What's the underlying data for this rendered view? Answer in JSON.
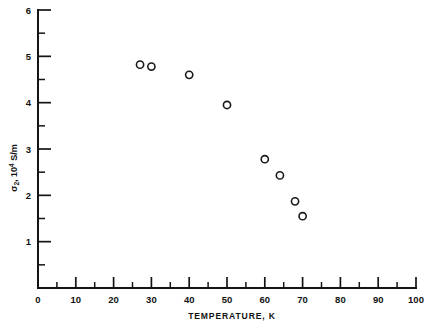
{
  "chart_data": {
    "type": "scatter",
    "title": "",
    "xlabel": "TEMPERATURE, K",
    "ylabel": "σ₂, 10⁴ S/m",
    "ylabel_parts": {
      "symbol": "σ",
      "subscript": "2",
      "separator": ", 10",
      "superscript": "4",
      "unit": " S/m"
    },
    "xlim": [
      0,
      100
    ],
    "ylim": [
      0,
      6
    ],
    "xticks": [
      0,
      10,
      20,
      30,
      40,
      50,
      60,
      70,
      80,
      90,
      100
    ],
    "xtick_labels": [
      "0",
      "10",
      "20",
      "30",
      "40",
      "50",
      "60",
      "70",
      "80",
      "90",
      "100"
    ],
    "yticks": [
      0,
      1,
      2,
      3,
      4,
      5,
      6
    ],
    "ytick_labels": [
      "",
      "1",
      "2",
      "3",
      "4",
      "5",
      "6"
    ],
    "grid": false,
    "legend": null,
    "marker": "open-circle",
    "marker_color": "#1a1a1a",
    "x": [
      27,
      30,
      40,
      50,
      60,
      64,
      68,
      70
    ],
    "y": [
      4.82,
      4.78,
      4.6,
      3.95,
      2.78,
      2.43,
      1.87,
      1.55
    ],
    "points": [
      {
        "x": 27,
        "y": 4.82
      },
      {
        "x": 30,
        "y": 4.78
      },
      {
        "x": 40,
        "y": 4.6
      },
      {
        "x": 50,
        "y": 3.95
      },
      {
        "x": 60,
        "y": 2.78
      },
      {
        "x": 64,
        "y": 2.43
      },
      {
        "x": 68,
        "y": 1.87
      },
      {
        "x": 70,
        "y": 1.55
      }
    ]
  }
}
